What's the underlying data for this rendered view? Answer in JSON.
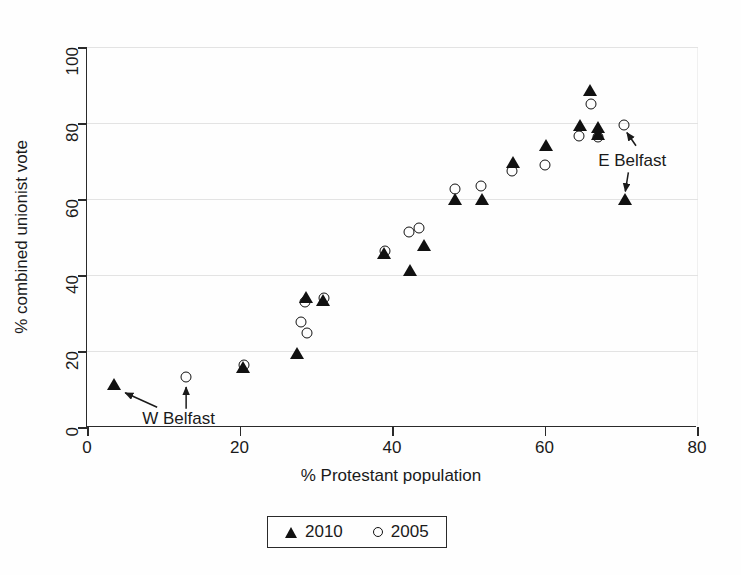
{
  "chart_data": {
    "type": "scatter",
    "title": "",
    "xlabel": "% Protestant population",
    "ylabel": "% combined unionist vote",
    "xlim": [
      0,
      80
    ],
    "ylim": [
      0,
      100
    ],
    "xticks": [
      0,
      20,
      40,
      60,
      80
    ],
    "yticks": [
      0,
      20,
      40,
      60,
      80,
      100
    ],
    "grid": "horizontal",
    "legend_position": "bottom-center",
    "series": [
      {
        "name": "2010",
        "marker": "filled-triangle",
        "color": "#111111",
        "points": [
          {
            "x": 3.5,
            "y": 11.0
          },
          {
            "x": 20.4,
            "y": 15.5
          },
          {
            "x": 27.6,
            "y": 19.3
          },
          {
            "x": 28.7,
            "y": 34.0
          },
          {
            "x": 30.9,
            "y": 33.2
          },
          {
            "x": 39.0,
            "y": 45.4
          },
          {
            "x": 42.4,
            "y": 41.0
          },
          {
            "x": 44.2,
            "y": 47.6
          },
          {
            "x": 48.3,
            "y": 59.7
          },
          {
            "x": 51.8,
            "y": 59.7
          },
          {
            "x": 55.9,
            "y": 69.6
          },
          {
            "x": 60.2,
            "y": 74.0
          },
          {
            "x": 64.6,
            "y": 79.1
          },
          {
            "x": 66.0,
            "y": 88.4
          },
          {
            "x": 67.0,
            "y": 78.6
          },
          {
            "x": 67.0,
            "y": 76.8
          },
          {
            "x": 70.5,
            "y": 59.8
          }
        ]
      },
      {
        "name": "2005",
        "marker": "open-circle",
        "color": "#111111",
        "points": [
          {
            "x": 13.0,
            "y": 13.2
          },
          {
            "x": 20.6,
            "y": 16.2
          },
          {
            "x": 28.0,
            "y": 27.6
          },
          {
            "x": 28.6,
            "y": 32.8
          },
          {
            "x": 28.9,
            "y": 24.7
          },
          {
            "x": 31.1,
            "y": 34.0
          },
          {
            "x": 39.1,
            "y": 46.3
          },
          {
            "x": 42.2,
            "y": 51.2
          },
          {
            "x": 43.6,
            "y": 52.5
          },
          {
            "x": 48.2,
            "y": 62.7
          },
          {
            "x": 51.7,
            "y": 63.3
          },
          {
            "x": 55.8,
            "y": 67.3
          },
          {
            "x": 60.1,
            "y": 68.9
          },
          {
            "x": 64.5,
            "y": 76.5
          },
          {
            "x": 66.1,
            "y": 85.0
          },
          {
            "x": 67.0,
            "y": 76.2
          },
          {
            "x": 70.4,
            "y": 79.4
          }
        ]
      }
    ],
    "annotations": [
      {
        "label": "W Belfast",
        "label_x": 12.0,
        "label_y": 2.0,
        "arrows": [
          {
            "from_x": 9.2,
            "from_y": 5.2,
            "to_x": 5.0,
            "to_y": 9.0
          },
          {
            "from_x": 13.0,
            "from_y": 4.8,
            "to_x": 13.0,
            "to_y": 10.5
          }
        ]
      },
      {
        "label": "E Belfast",
        "label_x": 71.5,
        "label_y": 70.0,
        "arrows": [
          {
            "from_x": 72.0,
            "from_y": 74.0,
            "to_x": 70.8,
            "to_y": 77.5
          },
          {
            "from_x": 71.0,
            "from_y": 67.0,
            "to_x": 70.6,
            "to_y": 62.0
          }
        ]
      }
    ]
  },
  "legend": {
    "entries": [
      {
        "label": "2010",
        "marker": "filled-triangle"
      },
      {
        "label": "2005",
        "marker": "open-circle"
      }
    ]
  },
  "axes": {
    "x_title": "% Protestant population",
    "y_title": "% combined unionist vote",
    "x_tick_labels": [
      "0",
      "20",
      "40",
      "60",
      "80"
    ],
    "y_tick_labels": [
      "0",
      "20",
      "40",
      "60",
      "80",
      "100"
    ]
  }
}
